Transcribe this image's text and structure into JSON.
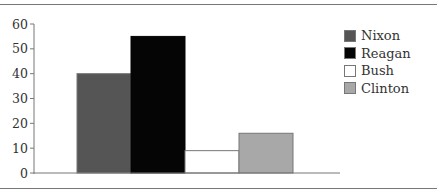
{
  "chart_data": {
    "type": "bar",
    "title": "",
    "xlabel": "",
    "ylabel": "",
    "categories": [
      "Nixon",
      "Reagan",
      "Bush",
      "Clinton"
    ],
    "values": [
      40,
      55,
      9,
      16
    ],
    "colors": [
      "#555555",
      "#050505",
      "#ffffff",
      "#a8a8a8"
    ],
    "ylim": [
      0,
      60
    ],
    "yticks": [
      0,
      10,
      20,
      30,
      40,
      50,
      60
    ],
    "grid": false,
    "legend_position": "right"
  },
  "legend": {
    "items": [
      {
        "label": "Nixon",
        "color": "#555555"
      },
      {
        "label": "Reagan",
        "color": "#050505"
      },
      {
        "label": "Bush",
        "color": "#ffffff"
      },
      {
        "label": "Clinton",
        "color": "#a8a8a8"
      }
    ]
  }
}
